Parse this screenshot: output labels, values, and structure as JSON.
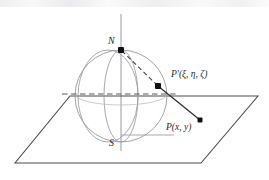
{
  "figure": {
    "caption_visible": false,
    "background_color": "#ffffff",
    "line_color": "#3a3a3a",
    "sphere_color": "#8a8a92",
    "point_color": "#141414",
    "labels": {
      "north_pole": "N",
      "south_pole": "S",
      "sphere_point": "P′(ξ, η, ζ)",
      "plane_point": "P(x, y)"
    },
    "geometry": {
      "axis": {
        "x": 121,
        "y_top": 14,
        "y_bottom": 151
      },
      "sphere": {
        "cx": 121,
        "cy": 96,
        "r": 46
      },
      "north_pole_point": {
        "x": 121,
        "y": 50
      },
      "south_pole_point": {
        "x": 121,
        "y": 142
      },
      "sphere_point": {
        "x": 158,
        "y": 86
      },
      "plane_point": {
        "x": 200,
        "y": 120
      },
      "plane_corners": [
        {
          "x": 70,
          "y": 96
        },
        {
          "x": 258,
          "y": 96
        },
        {
          "x": 201,
          "y": 163
        },
        {
          "x": 15,
          "y": 163
        }
      ],
      "equator_dashes": {
        "x_start": 62,
        "x_end": 176,
        "y": 94
      },
      "south_tick": {
        "x_start": 121,
        "x_end": 174,
        "y": 135
      }
    }
  }
}
